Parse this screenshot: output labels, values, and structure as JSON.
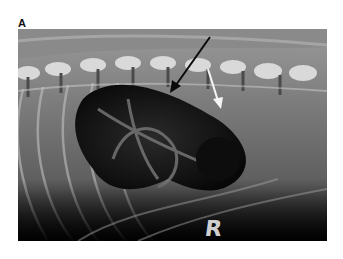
{
  "figure": {
    "panel_label": "A",
    "image_type": "lateral abdominal/thoracic radiograph",
    "side_marker": "R",
    "annotations": [
      {
        "type": "arrow",
        "color": "#111111",
        "description": "black arrow pointing to gas-distended stomach wall"
      },
      {
        "type": "arrow",
        "color": "#ffffff",
        "description": "white arrow pointing to soft tissue region caudal to stomach"
      }
    ],
    "colors": {
      "background": "#ffffff",
      "film_dark": "#0a0a0a",
      "soft_tissue": "#6e6e6e",
      "bone": "#e6e6e6"
    }
  }
}
